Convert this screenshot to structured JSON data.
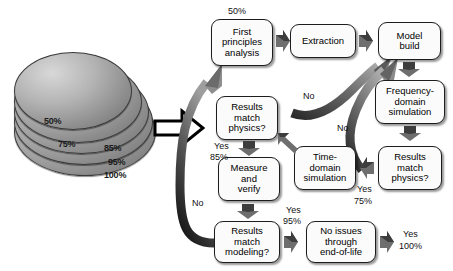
{
  "figure": {
    "type": "process-flowchart"
  },
  "disc_stack": {
    "name": "confidence-disc-stack",
    "labels": [
      "50%",
      "75%",
      "85%",
      "95%",
      "100%"
    ]
  },
  "boxes": [
    {
      "id": "first-principles-analysis",
      "label": "First\nprinciples\nanalysis"
    },
    {
      "id": "extraction",
      "label": "Extraction"
    },
    {
      "id": "model-build",
      "label": "Model\nbuild"
    },
    {
      "id": "frequency-domain-simulation",
      "label": "Frequency-\ndomain\nsimulation"
    },
    {
      "id": "results-match-physics-right",
      "label": "Results\nmatch\nphysics?"
    },
    {
      "id": "time-domain-simulation",
      "label": "Time-\ndomain\nsimulation"
    },
    {
      "id": "results-match-physics-left",
      "label": "Results\nmatch\nphysics?"
    },
    {
      "id": "measure-and-verify",
      "label": "Measure\nand\nverify"
    },
    {
      "id": "results-match-modeling",
      "label": "Results\nmatch\nmodeling?"
    },
    {
      "id": "no-issues-end-of-life",
      "label": "No issues\nthrough\nend-of-life"
    }
  ],
  "labels": {
    "start_pct": "50%",
    "yes_75_yes": "Yes",
    "yes_75_pct": "75%",
    "yes_85_yes": "Yes",
    "yes_85_pct": "85%",
    "yes_95_yes": "Yes",
    "yes_95_pct": "95%",
    "yes_100_yes": "Yes",
    "yes_100_pct": "100%",
    "no_upper": "No",
    "no_lower": "No",
    "no_left": "No"
  },
  "colors": {
    "box_fill": "#fbfbfb",
    "box_border": "#1d1d1d",
    "arrow_dark": "#4a4a4a",
    "arrow_light": "#9a9a9a",
    "disc_gray": "#9b9b9b",
    "text": "#000000"
  }
}
